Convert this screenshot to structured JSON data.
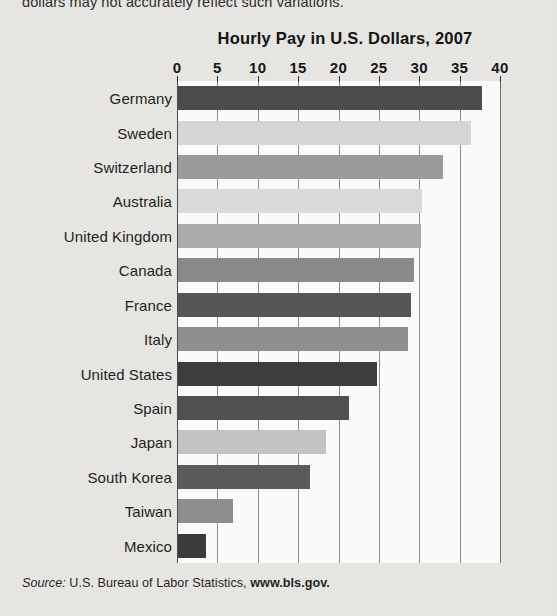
{
  "caption_cutoff": "dollars may not accurately reflect such variations.",
  "source": {
    "prefix": "Source:",
    "agency": "U.S. Bureau of Labor Statistics,",
    "url": "www.bls.gov."
  },
  "chart_data": {
    "type": "bar",
    "orientation": "horizontal",
    "title": "Hourly Pay in U.S. Dollars, 2007",
    "xlabel": "",
    "ylabel": "",
    "xlim": [
      0,
      40
    ],
    "xticks": [
      0,
      5,
      10,
      15,
      20,
      25,
      30,
      35,
      40
    ],
    "xtick_labels": [
      "0",
      "5",
      "10",
      "15",
      "20",
      "25",
      "30",
      "35",
      "40"
    ],
    "grid": true,
    "legend": "none",
    "categories": [
      "Germany",
      "Sweden",
      "Switzerland",
      "Australia",
      "United Kingdom",
      "Canada",
      "France",
      "Italy",
      "United States",
      "Spain",
      "Japan",
      "South Korea",
      "Taiwan",
      "Mexico"
    ],
    "values": [
      37.7,
      36.3,
      32.8,
      30.2,
      30.1,
      29.2,
      28.9,
      28.5,
      24.6,
      21.2,
      18.3,
      16.3,
      6.8,
      3.5
    ],
    "bar_colors": [
      "#4b4b4b",
      "#d8d8d8",
      "#9c9c9c",
      "#dcdcdc",
      "#acacac",
      "#8a8a8a",
      "#555555",
      "#909090",
      "#3c3c3c",
      "#4f4f4f",
      "#c4c4c4",
      "#5a5a5a",
      "#8e8e8e",
      "#3a3a3a"
    ],
    "plot_background": "#fdfdfb",
    "page_background": "#e9e8e4"
  }
}
